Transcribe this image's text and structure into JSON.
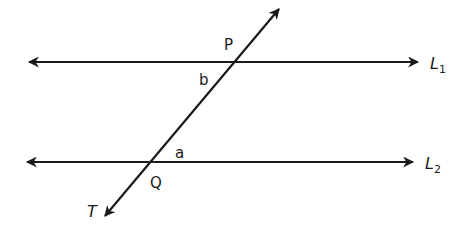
{
  "diagram": {
    "colors": {
      "line": "#1a1a1a",
      "background": "#ffffff"
    },
    "lines": [
      {
        "id": "L1",
        "label": "L",
        "subscript": "1",
        "x1": 27,
        "y1": 62,
        "x2": 420,
        "y2": 62
      },
      {
        "id": "L2",
        "label": "L",
        "subscript": "2",
        "x1": 25,
        "y1": 162,
        "x2": 415,
        "y2": 162
      },
      {
        "id": "T",
        "label": "T",
        "x1": 280,
        "y1": 8,
        "x2": 105,
        "y2": 217
      }
    ],
    "points": [
      {
        "label": "P",
        "x": 235,
        "y": 61
      },
      {
        "label": "Q",
        "x": 150,
        "y": 162
      }
    ],
    "angle_labels": [
      {
        "label": "b",
        "x": 202,
        "y": 84
      },
      {
        "label": "a",
        "x": 180,
        "y": 158
      }
    ],
    "point_labels": [
      {
        "label": "P",
        "x": 225,
        "y": 49
      },
      {
        "label": "Q",
        "x": 152,
        "y": 187
      }
    ],
    "line_labels": {
      "L1": {
        "text": "L",
        "sub": "1",
        "x": 430,
        "y": 68
      },
      "L2": {
        "text": "L",
        "sub": "2",
        "x": 425,
        "y": 168
      },
      "T": {
        "text": "T",
        "x": 88,
        "y": 216
      }
    }
  }
}
